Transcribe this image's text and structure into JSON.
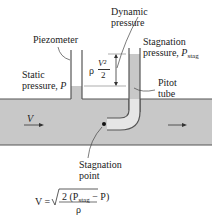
{
  "labels": {
    "piezometer": "Piezometer",
    "dynamic_pressure_line1": "Dynamic",
    "dynamic_pressure_line2": "pressure",
    "stagnation_pressure_line1": "Stagnation",
    "stagnation_pressure_line2": "pressure, ",
    "stagnation_symbol": "P",
    "stagnation_subscript": "stag",
    "static_pressure_line1": "Static",
    "static_pressure_line2": "pressure, ",
    "static_symbol": "P",
    "pitot_line1": "Pitot",
    "pitot_line2": "tube",
    "stagnation_point_line1": "Stagnation",
    "stagnation_point_line2": "point",
    "velocity_symbol": "V",
    "dynamic_expr_rho": "ρ",
    "dynamic_expr_num": "V²",
    "dynamic_expr_den": "2"
  },
  "formula": {
    "lhs": "V =",
    "numerator": "2 (P",
    "numerator_sub": "stag",
    "numerator_end": " − P)",
    "denominator": "ρ"
  },
  "colors": {
    "fluid": "#c8c8c8",
    "wall": "#555555",
    "background": "#ffffff"
  }
}
